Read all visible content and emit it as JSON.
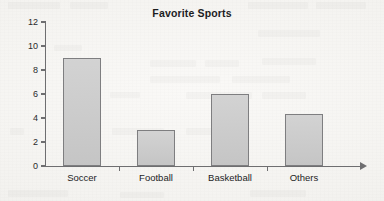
{
  "chart_data": {
    "type": "bar",
    "title": "Favorite Sports",
    "xlabel": "",
    "ylabel": "",
    "categories": [
      "Soccer",
      "Football",
      "Basketball",
      "Others"
    ],
    "values": [
      9,
      3,
      6,
      4.3
    ],
    "ylim": [
      0,
      12
    ],
    "yticks": [
      0,
      2,
      4,
      6,
      8,
      10,
      12
    ],
    "ytick_labels": [
      "0",
      "2",
      "4",
      "6",
      "8",
      "10",
      "12"
    ],
    "grid": false,
    "legend": null,
    "bar_fill_color": "#c9c9c9",
    "bar_border_color": "#7e7e80",
    "axis_color": "#6e6e70",
    "background_color": "#f5f4f1",
    "x_axis_has_arrow": true
  },
  "chart": {
    "title": "Favorite Sports",
    "axis_y_name": "y-axis",
    "axis_x_name": "x-axis"
  }
}
